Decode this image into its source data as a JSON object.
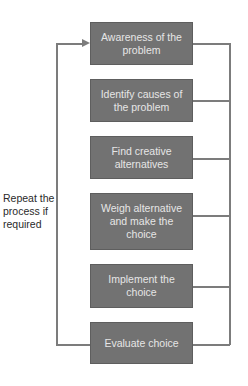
{
  "diagram": {
    "type": "flowchart-loop",
    "steps": [
      {
        "label": "Awareness of the problem"
      },
      {
        "label": "Identify causes of the problem"
      },
      {
        "label": "Find creative alternatives"
      },
      {
        "label": "Weigh alternative and make the choice"
      },
      {
        "label": "Implement the choice"
      },
      {
        "label": "Evaluate choice"
      }
    ],
    "loop_label": "Repeat the process if required",
    "colors": {
      "box_fill": "#727272",
      "box_text": "#e6e6e6",
      "line": "#7c7c7c",
      "label_text": "#2a2a2a"
    }
  }
}
